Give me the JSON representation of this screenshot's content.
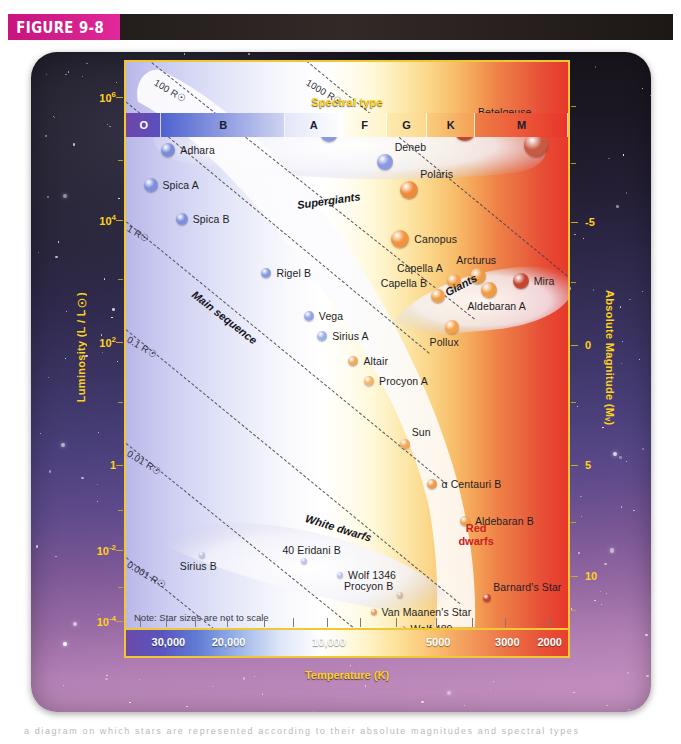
{
  "figure": {
    "label": "FIGURE 9-8",
    "caption_sliver": "a diagram on which stars are represented according to their absolute magnitudes and spectral types"
  },
  "axes": {
    "spectral": {
      "title": "Spectral type",
      "title_color": "#ffd21e",
      "bands": [
        {
          "type": "O",
          "start_pct": 0,
          "width_pct": 8,
          "color_left": "#6d45a8",
          "color_right": "#5a4fc0",
          "label_white": true
        },
        {
          "type": "B",
          "start_pct": 8,
          "width_pct": 28,
          "color_left": "#4e62cf",
          "color_right": "#cfd4f2",
          "label_white": false
        },
        {
          "type": "A",
          "start_pct": 36,
          "width_pct": 13,
          "color_left": "#e2e6f8",
          "color_right": "#ffffff",
          "label_white": false
        },
        {
          "type": "F",
          "start_pct": 49,
          "width_pct": 10,
          "color_left": "#fffdf0",
          "color_right": "#fff3c8",
          "label_white": false
        },
        {
          "type": "G",
          "start_pct": 59,
          "width_pct": 9,
          "color_left": "#fdeaae",
          "color_right": "#fbd98e",
          "label_white": false
        },
        {
          "type": "K",
          "start_pct": 68,
          "width_pct": 11,
          "color_left": "#f9cd7e",
          "color_right": "#f3a055",
          "label_white": false
        },
        {
          "type": "M",
          "start_pct": 79,
          "width_pct": 21,
          "color_left": "#ef7d47",
          "color_right": "#e8332a",
          "label_white": false
        }
      ]
    },
    "temperature": {
      "title": "Temperature (K)",
      "unit": "K",
      "title_color": "#ffd21e",
      "ticks": [
        {
          "label": "30,000",
          "pos_pct": 9.5
        },
        {
          "label": "20,000",
          "pos_pct": 23.0
        },
        {
          "label": "10,000",
          "pos_pct": 45.5
        },
        {
          "label": "5000",
          "pos_pct": 70.0
        },
        {
          "label": "3000",
          "pos_pct": 85.5
        },
        {
          "label": "2000",
          "pos_pct": 95.0
        }
      ],
      "minor_tick_pcts": [
        3.5,
        9.5,
        16.0,
        23.0,
        31.5,
        38.0,
        45.5,
        53.0,
        61.0,
        70.0,
        78.0,
        85.5,
        95.0
      ]
    },
    "luminosity": {
      "title": "Luminosity (L / L☉)",
      "title_color": "#ffd21e",
      "ticks": [
        {
          "label": "10",
          "exp": "6",
          "pos_pct": 6.5
        },
        {
          "label": "10",
          "exp": "4",
          "pos_pct": 28.0
        },
        {
          "label": "10",
          "exp": "2",
          "pos_pct": 49.5
        },
        {
          "label": "1",
          "exp": "",
          "pos_pct": 71.0
        },
        {
          "label": "10",
          "exp": "-2",
          "pos_pct": 86.0
        },
        {
          "label": "10",
          "exp": "-4",
          "pos_pct": 98.5
        }
      ],
      "minor_tick_pcts": [
        17.5,
        38.5,
        60.0,
        79.0,
        92.5
      ]
    },
    "magnitude": {
      "title": "Absolute Magnitude (Mᵥ)",
      "title_color": "#ffd21e",
      "ticks": [
        {
          "label": "-5",
          "pos_pct": 28.5
        },
        {
          "label": "0",
          "pos_pct": 50.0
        },
        {
          "label": "5",
          "pos_pct": 71.0
        },
        {
          "label": "10",
          "pos_pct": 90.5
        }
      ],
      "minor_tick_pcts": [
        8.0,
        18.0,
        39.0,
        60.0,
        81.0,
        96.5
      ]
    }
  },
  "regions": [
    {
      "name": "Supergiants",
      "x_pct": 45.5,
      "y_pct": 25.0,
      "rotate": -8,
      "style": "italic-bold"
    },
    {
      "name": "Main sequence",
      "x_pct": 24.0,
      "y_pct": 40.5,
      "rotate": 38,
      "style": "italic-bold"
    },
    {
      "name": "Giants",
      "x_pct": 75.5,
      "y_pct": 40.5,
      "rotate": -28,
      "style": "italic-bold"
    },
    {
      "name": "White dwarfs",
      "x_pct": 48.0,
      "y_pct": 80.0,
      "rotate": 17,
      "style": "italic-bold"
    },
    {
      "name": "Red\ndwarfs",
      "x_pct": 78.5,
      "y_pct": 83.0,
      "rotate": 0,
      "style": "red-bold"
    }
  ],
  "radius_lines": [
    {
      "label": "1000 R☉",
      "x1_pct": 38.0,
      "y1_pct": -2.0,
      "x2_pct": 100.0,
      "y2_pct": 38.0,
      "label_x_pct": 40.5,
      "label_y_pct": 2.5,
      "angle": 31
    },
    {
      "label": "100 R☉",
      "x1_pct": 4.0,
      "y1_pct": -1.0,
      "x2_pct": 78.0,
      "y2_pct": 45.0,
      "label_x_pct": 6.5,
      "label_y_pct": 2.5,
      "angle": 31
    },
    {
      "label": "10 R☉",
      "x1_pct": -6.0,
      "y1_pct": 3.0,
      "x2_pct": 68.0,
      "y2_pct": 51.0,
      "label_x_pct": 1.0,
      "label_y_pct": 9.0,
      "angle": 31
    },
    {
      "label": "1 R☉",
      "x1_pct": -6.0,
      "y1_pct": 24.0,
      "x2_pct": 72.0,
      "y2_pct": 74.0,
      "label_x_pct": 0.5,
      "label_y_pct": 28.0,
      "angle": 31
    },
    {
      "label": "0.1 R☉",
      "x1_pct": -6.0,
      "y1_pct": 43.0,
      "x2_pct": 75.0,
      "y2_pct": 95.0,
      "label_x_pct": 0.5,
      "label_y_pct": 47.5,
      "angle": 31
    },
    {
      "label": "0.01 R☉",
      "x1_pct": -6.0,
      "y1_pct": 63.0,
      "x2_pct": 76.0,
      "y2_pct": 115.0,
      "label_x_pct": 0.5,
      "label_y_pct": 67.5,
      "angle": 31
    },
    {
      "label": "0.001 R☉",
      "x1_pct": -6.0,
      "y1_pct": 83.0,
      "x2_pct": 60.0,
      "y2_pct": 125.0,
      "label_x_pct": 0.5,
      "label_y_pct": 87.0,
      "angle": 31
    }
  ],
  "stars": [
    {
      "name": "Alnilam",
      "x_pct": 13.0,
      "y_pct": 10.5,
      "r": 9,
      "color": "#7a8cd8",
      "label_side": "right"
    },
    {
      "name": "Adhara",
      "x_pct": 9.5,
      "y_pct": 15.5,
      "r": 7,
      "color": "#7a8cd8",
      "label_side": "right"
    },
    {
      "name": "Spica A",
      "x_pct": 5.5,
      "y_pct": 21.5,
      "r": 7,
      "color": "#7f8fdc",
      "label_side": "right"
    },
    {
      "name": "Spica B",
      "x_pct": 12.5,
      "y_pct": 27.5,
      "r": 6,
      "color": "#7f8fdc",
      "label_side": "right"
    },
    {
      "name": "Rigel A",
      "x_pct": 45.5,
      "y_pct": 12.5,
      "r": 9,
      "color": "#8b9ae0",
      "label_side": "right-above"
    },
    {
      "name": "Deneb",
      "x_pct": 58.0,
      "y_pct": 17.5,
      "r": 8,
      "color": "#8b9ae0",
      "label_side": "right-above"
    },
    {
      "name": "Betelgeuse",
      "x_pct": 76.0,
      "y_pct": 12.0,
      "r": 11,
      "color": "#c2452f",
      "label_side": "right-above"
    },
    {
      "name": "Antares",
      "x_pct": 92.0,
      "y_pct": 14.5,
      "r": 12,
      "color": "#c75a42",
      "label_side": "left-above"
    },
    {
      "name": "Polaris",
      "x_pct": 63.5,
      "y_pct": 22.5,
      "r": 9,
      "color": "#ef8a3c",
      "label_side": "right-above"
    },
    {
      "name": "Canopus",
      "x_pct": 61.5,
      "y_pct": 31.0,
      "r": 9,
      "color": "#f2933f",
      "label_side": "right"
    },
    {
      "name": "Rigel B",
      "x_pct": 31.5,
      "y_pct": 37.0,
      "r": 5,
      "color": "#8b9ae0",
      "label_side": "right"
    },
    {
      "name": "Capella A",
      "x_pct": 73.5,
      "y_pct": 38.5,
      "r": 7,
      "color": "#f0a04a",
      "label_side": "left-above"
    },
    {
      "name": "Capella B",
      "x_pct": 70.0,
      "y_pct": 41.0,
      "r": 7,
      "color": "#f0a04a",
      "label_side": "left-above"
    },
    {
      "name": "Arcturus",
      "x_pct": 79.0,
      "y_pct": 37.5,
      "r": 8,
      "color": "#ee9a46",
      "label_side": "above"
    },
    {
      "name": "Aldebaran A",
      "x_pct": 81.5,
      "y_pct": 40.0,
      "r": 8,
      "color": "#ef9a45",
      "label_side": "below"
    },
    {
      "name": "Mira",
      "x_pct": 88.5,
      "y_pct": 38.5,
      "r": 8,
      "color": "#c5462f",
      "label_side": "right"
    },
    {
      "name": "Vega",
      "x_pct": 41.0,
      "y_pct": 44.5,
      "r": 5,
      "color": "#93a4e4",
      "label_side": "right"
    },
    {
      "name": "Sirius A",
      "x_pct": 44.0,
      "y_pct": 48.0,
      "r": 5,
      "color": "#9ab0ea",
      "label_side": "right"
    },
    {
      "name": "Pollux",
      "x_pct": 73.0,
      "y_pct": 46.5,
      "r": 7,
      "color": "#f3a24c",
      "label_side": "below"
    },
    {
      "name": "Altair",
      "x_pct": 51.0,
      "y_pct": 52.5,
      "r": 5,
      "color": "#f0a95c",
      "label_side": "right"
    },
    {
      "name": "Procyon A",
      "x_pct": 54.5,
      "y_pct": 56.0,
      "r": 5,
      "color": "#f2b36a",
      "label_side": "right"
    },
    {
      "name": "Sun",
      "x_pct": 62.5,
      "y_pct": 67.0,
      "r": 5,
      "color": "#f2a958",
      "label_side": "right-above"
    },
    {
      "name": "α Centauri B",
      "x_pct": 68.5,
      "y_pct": 74.0,
      "r": 5,
      "color": "#ef9b4c",
      "label_side": "right"
    },
    {
      "name": "Aldebaran B",
      "x_pct": 76.0,
      "y_pct": 80.5,
      "r": 5,
      "color": "#eea04f",
      "label_side": "right"
    },
    {
      "name": "Sirius B",
      "x_pct": 17.0,
      "y_pct": 86.5,
      "r": 3,
      "color": "#b8c4ec",
      "label_side": "below"
    },
    {
      "name": "40 Eridani B",
      "x_pct": 40.0,
      "y_pct": 87.5,
      "r": 3,
      "color": "#b8c4ec",
      "label_side": "above"
    },
    {
      "name": "Wolf 1346",
      "x_pct": 48.0,
      "y_pct": 90.0,
      "r": 3,
      "color": "#b8c4ec",
      "label_side": "right"
    },
    {
      "name": "Procyon B",
      "x_pct": 61.5,
      "y_pct": 93.5,
      "r": 3,
      "color": "#d8b9a0",
      "label_side": "left-above"
    },
    {
      "name": "Van Maanen's Star",
      "x_pct": 55.5,
      "y_pct": 96.5,
      "r": 3,
      "color": "#e79a5c",
      "label_side": "right"
    },
    {
      "name": "Wolf 489",
      "x_pct": 62.0,
      "y_pct": 99.5,
      "r": 3,
      "color": "#e79a5c",
      "label_side": "right"
    },
    {
      "name": "Barnard's Star",
      "x_pct": 81.0,
      "y_pct": 94.0,
      "r": 4,
      "color": "#c4452f",
      "label_side": "right-above"
    }
  ],
  "plot_note": "Note: Star sizes are not to scale"
}
